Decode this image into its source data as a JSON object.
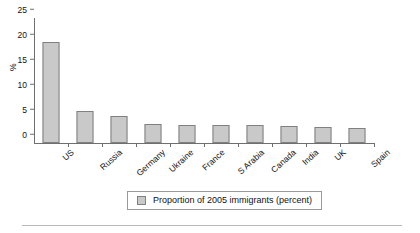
{
  "chart_data": {
    "type": "bar",
    "title": "",
    "subtitle": "",
    "xlabel": "",
    "ylabel": "%",
    "ylim": [
      0,
      25
    ],
    "yticks": [
      0,
      5,
      10,
      15,
      20,
      25
    ],
    "ytick_labels": [
      "0",
      "5",
      "10",
      "15",
      "20",
      "25"
    ],
    "grid": false,
    "legend_position": "bottom",
    "categories": [
      "US",
      "Russia",
      "Germany",
      "Ukraine",
      "France",
      "S Arabia",
      "Canada",
      "India",
      "UK",
      "Spain"
    ],
    "series": [
      {
        "name": "Proportion of 2005 immigrants (percent)",
        "values": [
          20.3,
          6.4,
          5.5,
          3.8,
          3.7,
          3.7,
          3.6,
          3.5,
          3.3,
          3.0
        ]
      }
    ],
    "bar_color": "#c9c9c9",
    "bar_border_color": "#808080",
    "axis_color": "#6f6f6f"
  },
  "legend": {
    "entries": [
      {
        "label": "Proportion of 2005 immigrants (percent)",
        "swatch_name": "legend-swatch-immigrants"
      }
    ]
  }
}
